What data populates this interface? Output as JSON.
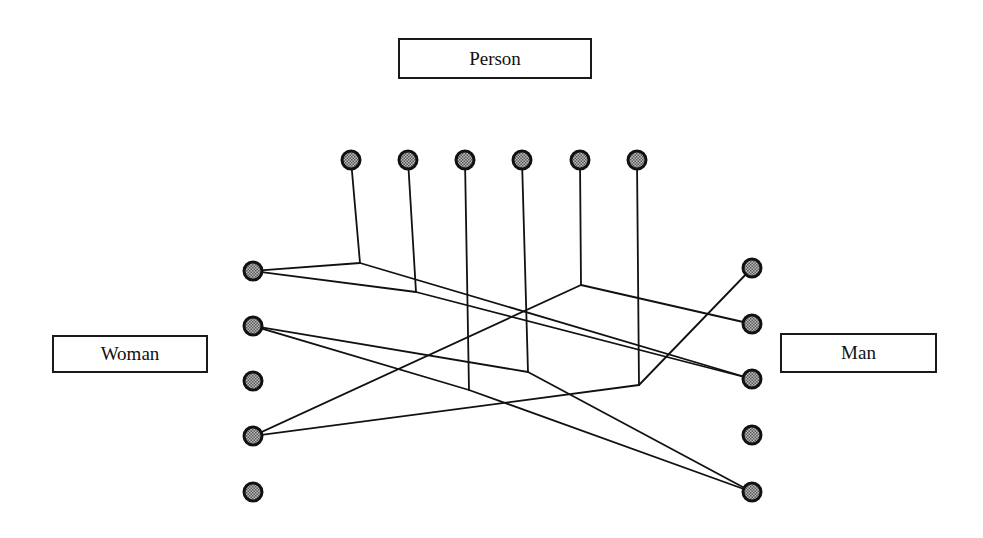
{
  "labels": {
    "person": "Person",
    "woman": "Woman",
    "man": "Man"
  },
  "colors": {
    "line": "#111111",
    "node_fill": "#8a8a8a",
    "node_stroke": "#111111"
  },
  "nodes": {
    "person": [
      {
        "id": "P1",
        "x": 351,
        "y": 160
      },
      {
        "id": "P2",
        "x": 408,
        "y": 160
      },
      {
        "id": "P3",
        "x": 465,
        "y": 160
      },
      {
        "id": "P4",
        "x": 522,
        "y": 160
      },
      {
        "id": "P5",
        "x": 580,
        "y": 160
      },
      {
        "id": "P6",
        "x": 637,
        "y": 160
      }
    ],
    "woman": [
      {
        "id": "W1",
        "x": 253,
        "y": 271
      },
      {
        "id": "W2",
        "x": 253,
        "y": 326
      },
      {
        "id": "W3",
        "x": 253,
        "y": 381
      },
      {
        "id": "W4",
        "x": 253,
        "y": 436
      },
      {
        "id": "W5",
        "x": 253,
        "y": 492
      }
    ],
    "man": [
      {
        "id": "M1",
        "x": 752,
        "y": 268
      },
      {
        "id": "M2",
        "x": 752,
        "y": 324
      },
      {
        "id": "M3",
        "x": 752,
        "y": 379
      },
      {
        "id": "M4",
        "x": 752,
        "y": 435
      },
      {
        "id": "M5",
        "x": 752,
        "y": 492
      }
    ]
  },
  "edges": [
    {
      "person": "P1",
      "junction": [
        360,
        263
      ],
      "woman": "W1",
      "man": "M3"
    },
    {
      "person": "P2",
      "junction": [
        416,
        292
      ],
      "woman": "W1",
      "man": "M3"
    },
    {
      "person": "P3",
      "junction": [
        469,
        390
      ],
      "woman": "W2",
      "man": "M5"
    },
    {
      "person": "P4",
      "junction": [
        528,
        372
      ],
      "woman": "W2",
      "man": "M5"
    },
    {
      "person": "P5",
      "junction": [
        581,
        285
      ],
      "woman": "W4",
      "man": "M2"
    },
    {
      "person": "P6",
      "junction": [
        639,
        385
      ],
      "woman": "W4",
      "man": "M1"
    }
  ]
}
